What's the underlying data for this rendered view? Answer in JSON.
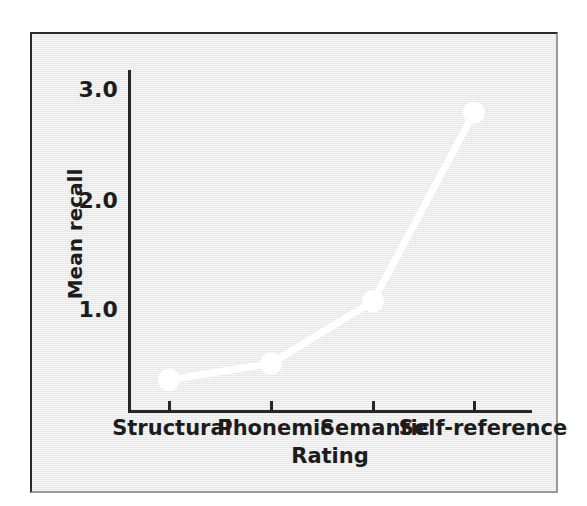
{
  "chart_data": {
    "type": "line",
    "title": "",
    "xlabel": "Rating",
    "ylabel": "Mean recall",
    "categories": [
      "Structural",
      "Phonemic",
      "Semantic",
      "Self-reference"
    ],
    "values": [
      0.35,
      0.5,
      1.07,
      2.8
    ],
    "series": [
      {
        "name": "Mean recall",
        "values": [
          0.35,
          0.5,
          1.07,
          2.8
        ]
      }
    ],
    "ytick_labels": [
      "1.0",
      "2.0",
      "3.0"
    ],
    "ytick_values": [
      1.0,
      2.0,
      3.0
    ],
    "ylim": [
      0,
      3.1
    ],
    "grid": false,
    "legend": "none",
    "marker": "circle",
    "marker_color": "#ffffff",
    "line_color": "#ffffff",
    "plot_background": "#e4e4e4",
    "axis_color": "#262626",
    "text_color": "#1c1c1c"
  },
  "axes": {
    "y_ticks": [
      {
        "label": "3.0",
        "value": 3.0
      },
      {
        "label": "2.0",
        "value": 2.0
      },
      {
        "label": "1.0",
        "value": 1.0
      }
    ],
    "y_title": "Mean recall",
    "x_title": "Rating",
    "x_categories": [
      {
        "label": "Structural"
      },
      {
        "label": "Phonemic"
      },
      {
        "label": "Semantic"
      },
      {
        "label": "Self-reference"
      }
    ]
  }
}
